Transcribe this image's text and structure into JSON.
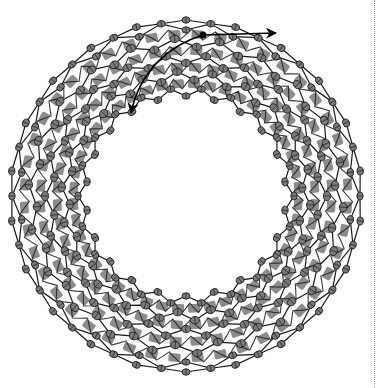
{
  "figure": {
    "center": [
      186,
      196
    ],
    "outer_radius": 176,
    "inner_radius": 98,
    "layers": 5,
    "atoms_per_layer": 44,
    "colors": {
      "background": "#ffffff",
      "atom_fill": "#7a7a7a",
      "atom_stroke": "#222222",
      "bond": "#1a1a1a",
      "block": "#8c8c8c",
      "block_highlight": "#ffffff",
      "arrow": "#000000",
      "divider": "#9a9a9a"
    },
    "arrows": [
      {
        "name": "tangential-arrow",
        "from": [
          203,
          35
        ],
        "to": [
          276,
          33
        ]
      },
      {
        "name": "inward-curved-arrow",
        "from": [
          203,
          35
        ],
        "to": [
          131,
          113
        ]
      }
    ],
    "marker_dot": [
      203,
      35
    ]
  }
}
